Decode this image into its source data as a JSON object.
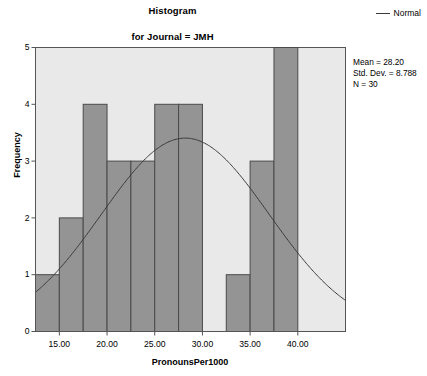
{
  "chart_data": {
    "type": "bar",
    "title": "Histogram",
    "subtitle": "for Journal = JMH",
    "xlabel": "PronounsPer1000",
    "ylabel": "Frequency",
    "xlim": [
      12.5,
      45.0
    ],
    "ylim": [
      0,
      5
    ],
    "grid": false,
    "bin_width": 2.5,
    "bin_starts": [
      12.5,
      15.0,
      17.5,
      20.0,
      22.5,
      25.0,
      27.5,
      30.0,
      32.5,
      35.0,
      37.5,
      40.0
    ],
    "categories": [
      "12.5-15.0",
      "15.0-17.5",
      "17.5-20.0",
      "20.0-22.5",
      "22.5-25.0",
      "25.0-27.5",
      "27.5-30.0",
      "30.0-32.5",
      "32.5-35.0",
      "35.0-37.5",
      "37.5-40.0",
      "40.0-42.5"
    ],
    "values": [
      1,
      2,
      4,
      3,
      3,
      4,
      4,
      0,
      1,
      3,
      5,
      0
    ],
    "xticks": [
      15.0,
      20.0,
      25.0,
      30.0,
      35.0,
      40.0
    ],
    "xtick_labels": [
      "15.00",
      "20.00",
      "25.00",
      "30.00",
      "35.00",
      "40.00"
    ],
    "yticks": [
      0,
      1,
      2,
      3,
      4,
      5
    ],
    "ytick_labels": [
      "0",
      "1",
      "2",
      "3",
      "4",
      "5"
    ],
    "series": [
      {
        "name": "Normal",
        "type": "line",
        "mean": 28.2,
        "std_dev": 8.788,
        "n": 30,
        "peak_value": 3.405
      }
    ],
    "legend": {
      "position": "top-right",
      "entries": [
        "Normal"
      ]
    },
    "annotations": {
      "mean": "Mean = 28.20",
      "std_dev": "Std. Dev. = 8.788",
      "n": "N = 30"
    },
    "colors": {
      "bar_fill": "#949494",
      "bar_edge": "#4a4a4a",
      "plot_background": "#e9e9e9",
      "curve": "#3a3a3a",
      "axis": "#555555",
      "text": "#000000"
    }
  }
}
